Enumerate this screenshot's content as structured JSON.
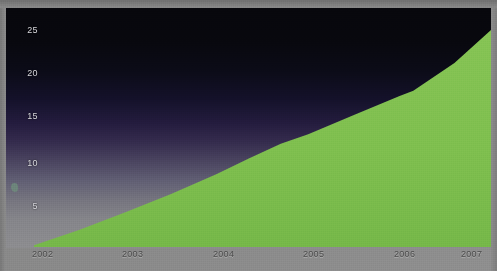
{
  "chart_data": {
    "type": "area",
    "title": "",
    "subtitle": "",
    "xlabel": "",
    "ylabel": "",
    "x": [
      2002,
      2003,
      2004,
      2005,
      2006,
      2007
    ],
    "categories": [
      "2002",
      "2003",
      "2004",
      "2005",
      "2006",
      "2007"
    ],
    "values": [
      0.2,
      4.0,
      8.4,
      13.0,
      17.4,
      25.0
    ],
    "series": [
      {
        "name": "",
        "values": [
          0.2,
          4.0,
          8.4,
          13.0,
          17.4,
          25.0
        ]
      }
    ],
    "detail_points": [
      {
        "x": 2002.0,
        "y": 0.2
      },
      {
        "x": 2002.5,
        "y": 2.0
      },
      {
        "x": 2003.0,
        "y": 4.0
      },
      {
        "x": 2003.5,
        "y": 6.1
      },
      {
        "x": 2004.0,
        "y": 8.4
      },
      {
        "x": 2004.35,
        "y": 10.2
      },
      {
        "x": 2004.7,
        "y": 11.9
      },
      {
        "x": 2005.0,
        "y": 13.0
      },
      {
        "x": 2005.5,
        "y": 15.2
      },
      {
        "x": 2006.0,
        "y": 17.4
      },
      {
        "x": 2006.15,
        "y": 18.0
      },
      {
        "x": 2006.6,
        "y": 21.2
      },
      {
        "x": 2007.0,
        "y": 25.0
      }
    ],
    "ylim": [
      0,
      26.5
    ],
    "xlim": [
      2002,
      2007
    ],
    "yticks": [
      5,
      10,
      15,
      20,
      25
    ],
    "ytick_labels": [
      "5",
      "10",
      "15",
      "20",
      "25"
    ],
    "xticks": [
      2002,
      2003,
      2004,
      2005,
      2006,
      2007
    ],
    "xtick_labels": [
      "2002",
      "2003",
      "2004",
      "2005",
      "2006",
      "2007"
    ],
    "grid": true,
    "grid_axis": "y",
    "legend": false,
    "legend_position": "none",
    "annotations": []
  },
  "axis": {
    "y_ticks": [
      {
        "label": "25",
        "value": 25
      },
      {
        "label": "20",
        "value": 20
      },
      {
        "label": "15",
        "value": 15
      },
      {
        "label": "10",
        "value": 10
      },
      {
        "label": "5",
        "value": 5
      }
    ],
    "x_ticks": [
      {
        "label": "2002",
        "value": 2002
      },
      {
        "label": "2003",
        "value": 2003
      },
      {
        "label": "2004",
        "value": 2004
      },
      {
        "label": "2005",
        "value": 2005
      },
      {
        "label": "2006",
        "value": 2006
      },
      {
        "label": "2007",
        "value": 2007
      }
    ]
  },
  "colors": {
    "area_fill": "#7fbf4f",
    "panel_top": "#07070c",
    "panel_mid": "#352c4e",
    "panel_bottom": "#8d8d90",
    "gridline": "#6b5f80",
    "y_label": "#d7d7dc",
    "x_label": "#4d4d4d",
    "card_background": "#8d8d8d"
  }
}
